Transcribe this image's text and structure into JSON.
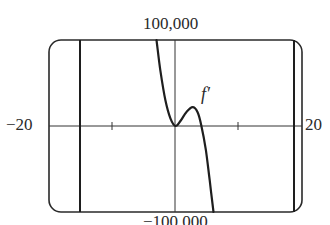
{
  "chart_data": {
    "type": "line",
    "title": "",
    "xlabel": "",
    "ylabel": "",
    "xlim": [
      -20,
      20
    ],
    "ylim": [
      -100000,
      100000
    ],
    "window_labels": {
      "ymax": "100,000",
      "ymin": "−100,000",
      "xmin": "−20",
      "xmax": "20"
    },
    "x_ticks": [
      -10,
      10
    ],
    "grid": false,
    "vertical_lines_x": [
      -15,
      19
    ],
    "series": [
      {
        "name": "f′",
        "x": [
          -3.0,
          -2.4,
          -1.6,
          -0.8,
          0.0,
          0.8,
          1.7,
          2.7,
          3.5,
          4.1,
          4.8,
          5.4,
          6.0
        ],
        "y": [
          100000,
          65000,
          30000,
          9000,
          0,
          6000,
          16000,
          22000,
          16000,
          0,
          -28000,
          -63000,
          -100000
        ]
      }
    ],
    "annotations": [
      {
        "text": "f′",
        "x": 4.5,
        "y": 36000
      }
    ]
  },
  "labels": {
    "top": "100,000",
    "bottom": "−100,000",
    "left": "−20",
    "right": "20",
    "curve": "f′"
  }
}
